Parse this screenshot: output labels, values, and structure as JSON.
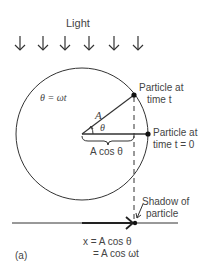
{
  "diagram": {
    "light_label": "Light",
    "light_arrow_count": 6,
    "omega_eq": "θ = ωt",
    "radius_label": "A",
    "angle_label": "θ",
    "projection_label": "A cos θ",
    "particle_t_line1": "Particle at",
    "particle_t_line2": "time t",
    "particle_0_line1": "Particle at",
    "particle_0_line2": "time t = 0",
    "shadow_line1": "Shadow of",
    "shadow_line2": "particle",
    "eq_line1": "x = A cos θ",
    "eq_line2": "= A cos ωt",
    "panel_label": "(a)",
    "colors": {
      "stroke": "#333333",
      "text": "#444444",
      "background": "#ffffff"
    }
  }
}
